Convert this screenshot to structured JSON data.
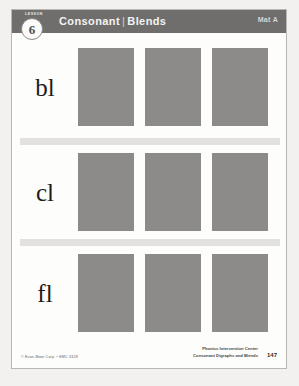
{
  "header": {
    "lesson_word": "LESSON",
    "lesson_number": "6",
    "title_primary": "Consonant",
    "title_separator": "|",
    "title_secondary": "Blends",
    "right_marker": "Mat A",
    "bar_color": "#6f6e6c"
  },
  "rows": [
    {
      "label": "bl",
      "pictures": [
        "picture-placeholder",
        "picture-placeholder",
        "picture-placeholder"
      ]
    },
    {
      "label": "cl",
      "pictures": [
        "picture-placeholder",
        "picture-placeholder",
        "picture-placeholder"
      ]
    },
    {
      "label": "fl",
      "pictures": [
        "picture-placeholder",
        "picture-placeholder",
        "picture-placeholder"
      ]
    }
  ],
  "footer": {
    "copyright": "© Evan-Moor Corp. • EMC 3328",
    "series_line1": "Phonics Intervention Center",
    "series_line2": "Consonant Digraphs and Blends",
    "page_number": "147"
  },
  "colors": {
    "picture_placeholder": "#8c8b89",
    "divider": "#e2e1df",
    "page_background": "#fdfdfc",
    "scan_background": "#f2f1ef"
  }
}
